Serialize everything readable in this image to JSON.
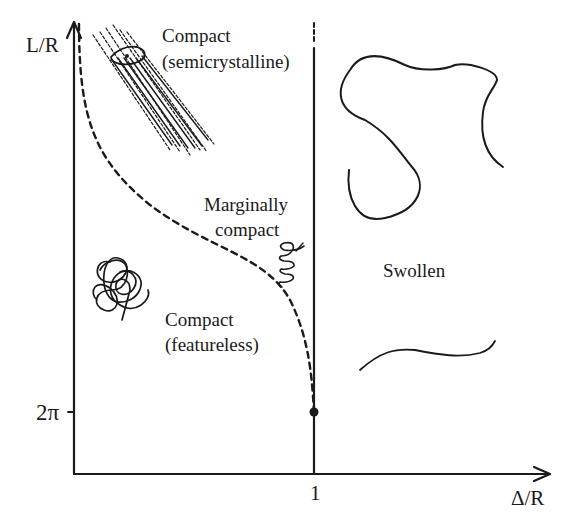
{
  "axes": {
    "y_label": "L/R",
    "x_label": "Δ/R",
    "y_tick": "2π",
    "x_tick": "1"
  },
  "regions": {
    "compact_semicrystalline": [
      "Compact",
      "(semicrystalline)"
    ],
    "marginally_compact": [
      "Marginally",
      "compact"
    ],
    "compact_featureless": [
      "Compact",
      "(featureless)"
    ],
    "swollen": "Swollen"
  },
  "boundaries": {
    "dashed_curve": "transition between compact and marginally compact phases, ending at (Δ/R = 1, L/R = 2π)",
    "vertical_line": "Δ/R = 1 separating compact from swollen",
    "endpoint_marker": "filled dot at (1, 2π)"
  },
  "colors": {
    "ink": "#1a1a1a",
    "background": "#ffffff"
  }
}
